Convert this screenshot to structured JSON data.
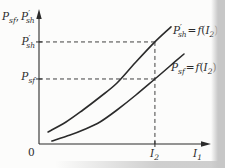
{
  "labels": {
    "y_axis_title": {
      "p1": "P",
      "p1_sub": "sf",
      "comma": ",",
      "p2": "P",
      "p2_prime": "′",
      "p2_sub": "sh"
    },
    "y_marker_upper": {
      "base": "P",
      "prime": "′",
      "sub": "sh"
    },
    "y_marker_lower": {
      "base": "P",
      "sub": "sf"
    },
    "origin": "0",
    "x_marker": {
      "base": "I",
      "sub": "2"
    },
    "x_axis": {
      "base": "I",
      "sub": "1"
    },
    "curve_upper": {
      "base": "P",
      "prime": "′",
      "sub": "sh",
      "equals": "=",
      "fn": "f",
      "open": "(",
      "arg": "I",
      "arg_sub": "2",
      "close": ")"
    },
    "curve_lower": {
      "base": "P",
      "sub": "sf",
      "equals": "=",
      "fn": "f",
      "open": "(",
      "arg": "I",
      "arg_sub": "2",
      "close": ")"
    }
  },
  "colors": {
    "ink": "#2b2b2b",
    "background": "#fcfcfb",
    "page_edge": "#c7c7c7"
  },
  "chart_data": {
    "type": "line",
    "title": "",
    "xlabel": "I₁",
    "ylabel": "Pₛf, P′ₛₕ",
    "axis_numeric_scale": false,
    "units": "normalized 0–1 (no numeric ticks printed on axes)",
    "grid": false,
    "legend_position": "labels at curve ends",
    "series": [
      {
        "name": "P′sh = f(I₂)",
        "x": [
          0.054,
          0.161,
          0.262,
          0.363,
          0.464,
          0.577,
          0.69,
          0.786
        ],
        "y": [
          0.095,
          0.175,
          0.27,
          0.373,
          0.484,
          0.651,
          0.81,
          0.929
        ]
      },
      {
        "name": "Psf = f(I₂)",
        "x": [
          0.077,
          0.185,
          0.262,
          0.363,
          0.464,
          0.577,
          0.69,
          0.78,
          0.863
        ],
        "y": [
          0.024,
          0.071,
          0.111,
          0.175,
          0.27,
          0.389,
          0.516,
          0.619,
          0.714
        ]
      }
    ],
    "guides": {
      "style": "dashed",
      "x_marker": 0.69,
      "x_marker_label": "I₂",
      "y_upper": 0.81,
      "y_upper_label": "P′ₛₕ",
      "y_lower": 0.516,
      "y_lower_label": "Pₛf"
    }
  }
}
